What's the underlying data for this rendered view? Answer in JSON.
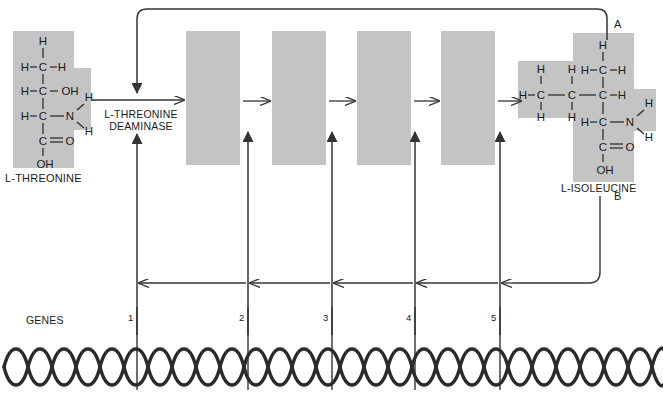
{
  "diagram": {
    "type": "biochemical-pathway",
    "background_color": "#ffffff",
    "box_fill": "#c4c4c4",
    "line_color": "#333333"
  },
  "substrate": {
    "name": "L-THREONINE",
    "atoms": {
      "h_top": "H",
      "h_left_1": "H",
      "c_1": "C",
      "h_right_1": "H",
      "h_left_2": "H",
      "c_2": "C",
      "oh_2": "OH",
      "h_left_3": "H",
      "c_3": "C",
      "n_3": "N",
      "h_n_upper": "H",
      "h_n_lower": "H",
      "c_4": "C",
      "o_4": "O",
      "oh_4": "OH"
    }
  },
  "product": {
    "name": "L-ISOLEUCINE",
    "atoms": {
      "h_top": "H",
      "h_left_top": "H",
      "c_top": "C",
      "h_right_top": "H",
      "h_up_a": "H",
      "h_up_b": "H",
      "h_left_chain": "H",
      "c_chain_a": "C",
      "c_chain_b": "C",
      "c_chain_c": "C",
      "h_right_chain": "H",
      "h_dn_a": "H",
      "h_dn_b": "H",
      "h_left_amine": "H",
      "c_amine": "C",
      "n_amine": "N",
      "h_n_upper": "H",
      "h_n_lower": "H",
      "c_acid": "C",
      "o_acid": "O",
      "oh_acid": "OH"
    }
  },
  "enzyme": {
    "line_1": "L-THREONINE",
    "line_2": "DEAMINASE"
  },
  "intermediates": [
    {
      "index": 1,
      "label": ""
    },
    {
      "index": 2,
      "label": ""
    },
    {
      "index": 3,
      "label": ""
    },
    {
      "index": 4,
      "label": ""
    },
    {
      "index": 5,
      "label": ""
    }
  ],
  "genes": {
    "label": "GENES",
    "numbers": [
      "1",
      "2",
      "3",
      "4",
      "5"
    ]
  },
  "feedback": {
    "loop_a_label": "A",
    "loop_b_label": "B"
  }
}
